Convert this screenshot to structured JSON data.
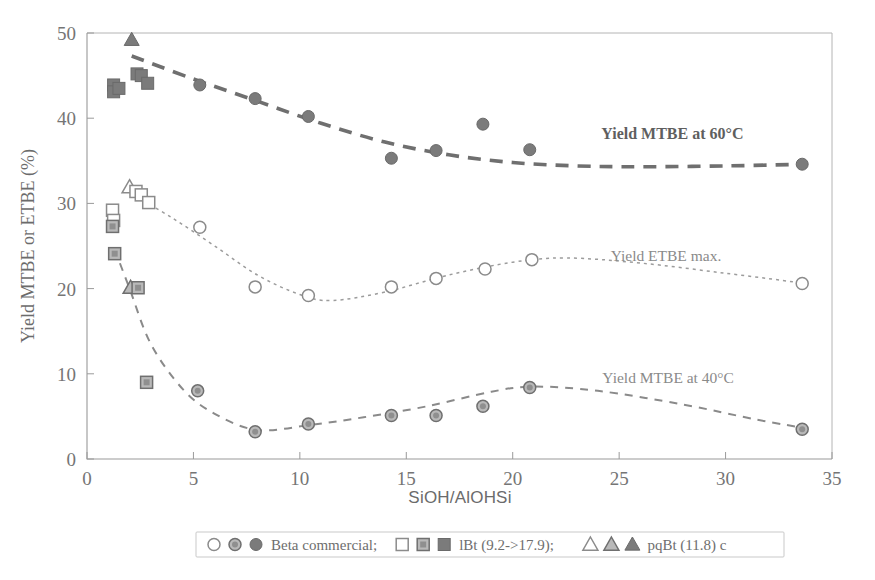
{
  "figure": {
    "background": "#ffffff",
    "frame_color": "#b4b4b4"
  },
  "axes": {
    "x_label": "SiOH/AlOHSi",
    "y_label": "Yield MTBE or ETBE (%)",
    "x_ticks": [
      "0",
      "5",
      "10",
      "15",
      "20",
      "25",
      "30",
      "35"
    ],
    "y_ticks": [
      "0",
      "10",
      "20",
      "30",
      "40",
      "50"
    ],
    "xlim": [
      0,
      35
    ],
    "ylim": [
      0,
      50
    ]
  },
  "annotations": [
    {
      "name": "annot-mtbe-60",
      "text": "Yield MTBE at 60°C",
      "x": 27.5,
      "y": 37.6,
      "style": "bold"
    },
    {
      "name": "annot-etbe-max",
      "text": "Yield ETBE max.",
      "x": 27.2,
      "y": 23.2,
      "style": "light"
    },
    {
      "name": "annot-mtbe-40",
      "text": "Yield MTBE at 40°C",
      "x": 27.3,
      "y": 8.9,
      "style": "light"
    }
  ],
  "legend": {
    "entries": [
      {
        "markers": [
          "circle-open",
          "circle-half",
          "circle-filled"
        ],
        "label": "Beta commercial;"
      },
      {
        "markers": [
          "square-open",
          "square-half",
          "square-filled"
        ],
        "label": "lBt (9.2->17.9);"
      },
      {
        "markers": [
          "triangle-open",
          "triangle-half",
          "triangle-filled"
        ],
        "label": "pqBt (11.8) c"
      }
    ]
  },
  "chart_data": {
    "type": "scatter",
    "title": "",
    "xlabel": "SiOH/AlOHSi",
    "ylabel": "Yield MTBE or ETBE (%)",
    "xlim": [
      0,
      35
    ],
    "ylim": [
      0,
      50
    ],
    "grid": false,
    "legend_position": "bottom",
    "series": [
      {
        "name": "Yield MTBE at 60°C",
        "marker": "filled",
        "color": "#7b7b7b",
        "points": [
          {
            "x": 1.25,
            "y": 43.9,
            "marker": "square-filled"
          },
          {
            "x": 1.25,
            "y": 43.1,
            "marker": "square-filled"
          },
          {
            "x": 1.5,
            "y": 43.5,
            "marker": "square-filled"
          },
          {
            "x": 2.1,
            "y": 49.2,
            "marker": "triangle-filled"
          },
          {
            "x": 2.35,
            "y": 45.2,
            "marker": "square-filled"
          },
          {
            "x": 2.55,
            "y": 45.0,
            "marker": "square-filled"
          },
          {
            "x": 2.85,
            "y": 44.1,
            "marker": "square-filled"
          },
          {
            "x": 5.3,
            "y": 43.9,
            "marker": "circle-filled"
          },
          {
            "x": 7.9,
            "y": 42.3,
            "marker": "circle-filled"
          },
          {
            "x": 10.4,
            "y": 40.2,
            "marker": "circle-filled"
          },
          {
            "x": 14.3,
            "y": 35.3,
            "marker": "circle-filled"
          },
          {
            "x": 16.4,
            "y": 36.2,
            "marker": "circle-filled"
          },
          {
            "x": 18.6,
            "y": 39.3,
            "marker": "circle-filled"
          },
          {
            "x": 20.8,
            "y": 36.3,
            "marker": "circle-filled"
          },
          {
            "x": 33.6,
            "y": 34.6,
            "marker": "circle-filled"
          }
        ],
        "trend": [
          {
            "x": 2.1,
            "y": 47.3
          },
          {
            "x": 5.0,
            "y": 44.6
          },
          {
            "x": 8.0,
            "y": 42.0
          },
          {
            "x": 11.0,
            "y": 39.4
          },
          {
            "x": 14.0,
            "y": 37.2
          },
          {
            "x": 17.0,
            "y": 35.7
          },
          {
            "x": 20.0,
            "y": 34.8
          },
          {
            "x": 23.0,
            "y": 34.4
          },
          {
            "x": 26.0,
            "y": 34.3
          },
          {
            "x": 30.0,
            "y": 34.4
          },
          {
            "x": 33.8,
            "y": 34.6
          }
        ]
      },
      {
        "name": "Yield ETBE max.",
        "marker": "open",
        "color": "#9c9c9c",
        "points": [
          {
            "x": 1.2,
            "y": 29.2,
            "marker": "square-open"
          },
          {
            "x": 1.25,
            "y": 28.0,
            "marker": "square-open"
          },
          {
            "x": 2.0,
            "y": 31.9,
            "marker": "triangle-open"
          },
          {
            "x": 2.3,
            "y": 31.4,
            "marker": "square-open"
          },
          {
            "x": 2.55,
            "y": 31.0,
            "marker": "square-open"
          },
          {
            "x": 2.9,
            "y": 30.1,
            "marker": "square-open"
          },
          {
            "x": 5.3,
            "y": 27.2,
            "marker": "circle-open"
          },
          {
            "x": 7.9,
            "y": 20.2,
            "marker": "circle-open"
          },
          {
            "x": 10.4,
            "y": 19.2,
            "marker": "circle-open"
          },
          {
            "x": 14.3,
            "y": 20.2,
            "marker": "circle-open"
          },
          {
            "x": 16.4,
            "y": 21.2,
            "marker": "circle-open"
          },
          {
            "x": 18.7,
            "y": 22.3,
            "marker": "circle-open"
          },
          {
            "x": 20.9,
            "y": 23.4,
            "marker": "circle-open"
          },
          {
            "x": 33.6,
            "y": 20.6,
            "marker": "circle-open"
          }
        ],
        "trend": [
          {
            "x": 2.1,
            "y": 31.1
          },
          {
            "x": 4.0,
            "y": 28.3
          },
          {
            "x": 6.0,
            "y": 25.0
          },
          {
            "x": 8.0,
            "y": 21.6
          },
          {
            "x": 10.0,
            "y": 19.3
          },
          {
            "x": 11.5,
            "y": 18.6
          },
          {
            "x": 14.0,
            "y": 19.6
          },
          {
            "x": 17.0,
            "y": 21.6
          },
          {
            "x": 20.0,
            "y": 23.1
          },
          {
            "x": 22.5,
            "y": 23.6
          },
          {
            "x": 26.0,
            "y": 23.0
          },
          {
            "x": 30.0,
            "y": 21.8
          },
          {
            "x": 33.8,
            "y": 20.6
          }
        ]
      },
      {
        "name": "Yield MTBE at 40°C",
        "marker": "half",
        "color": "#8a8a8a",
        "points": [
          {
            "x": 1.2,
            "y": 27.3,
            "marker": "square-half"
          },
          {
            "x": 1.3,
            "y": 24.1,
            "marker": "square-half"
          },
          {
            "x": 2.05,
            "y": 20.1,
            "marker": "triangle-half"
          },
          {
            "x": 2.4,
            "y": 20.1,
            "marker": "square-half"
          },
          {
            "x": 2.8,
            "y": 9.0,
            "marker": "square-half"
          },
          {
            "x": 5.2,
            "y": 8.0,
            "marker": "circle-half"
          },
          {
            "x": 7.9,
            "y": 3.2,
            "marker": "circle-half"
          },
          {
            "x": 10.4,
            "y": 4.1,
            "marker": "circle-half"
          },
          {
            "x": 14.3,
            "y": 5.1,
            "marker": "circle-half"
          },
          {
            "x": 16.4,
            "y": 5.1,
            "marker": "circle-half"
          },
          {
            "x": 18.6,
            "y": 6.2,
            "marker": "circle-half"
          },
          {
            "x": 20.8,
            "y": 8.4,
            "marker": "circle-half"
          },
          {
            "x": 33.6,
            "y": 3.5,
            "marker": "circle-half"
          }
        ],
        "trend": [
          {
            "x": 1.3,
            "y": 24.6
          },
          {
            "x": 2.0,
            "y": 20.0
          },
          {
            "x": 3.0,
            "y": 13.5
          },
          {
            "x": 4.5,
            "y": 8.2
          },
          {
            "x": 6.0,
            "y": 5.3
          },
          {
            "x": 8.0,
            "y": 3.4
          },
          {
            "x": 10.5,
            "y": 4.0
          },
          {
            "x": 13.0,
            "y": 4.9
          },
          {
            "x": 16.0,
            "y": 6.2
          },
          {
            "x": 19.0,
            "y": 7.9
          },
          {
            "x": 21.0,
            "y": 8.5
          },
          {
            "x": 24.0,
            "y": 8.0
          },
          {
            "x": 28.0,
            "y": 6.4
          },
          {
            "x": 31.5,
            "y": 4.6
          },
          {
            "x": 33.8,
            "y": 3.6
          }
        ]
      }
    ]
  }
}
